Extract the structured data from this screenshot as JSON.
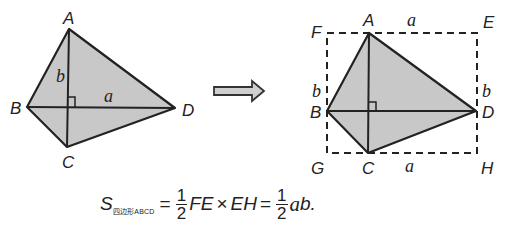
{
  "left_figure": {
    "vertices": {
      "A": "A",
      "B": "B",
      "C": "C",
      "D": "D"
    },
    "segment_labels": {
      "ac": "b",
      "bd": "a"
    },
    "fill_color": "#c8c8c8",
    "stroke_color": "#222222"
  },
  "arrow": {
    "direction": "right",
    "fill_color": "#cfcfcf"
  },
  "right_figure": {
    "vertices": {
      "A": "A",
      "B": "B",
      "C": "C",
      "D": "D",
      "E": "E",
      "F": "F",
      "G": "G",
      "H": "H"
    },
    "segment_labels": {
      "top": "a",
      "bottom": "a",
      "left": "b",
      "right": "b"
    }
  },
  "formula": {
    "S": "S",
    "subscript": "四边形ABCD",
    "eq1": "=",
    "frac1_num": "1",
    "frac1_den": "2",
    "term1": "FE",
    "times": "×",
    "term2": "EH",
    "eq2": "=",
    "frac2_num": "1",
    "frac2_den": "2",
    "a": "a",
    "tail": "b."
  }
}
